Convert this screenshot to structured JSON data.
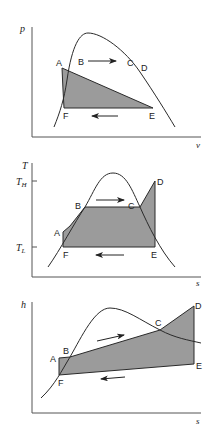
{
  "colors": {
    "line": "#2a2a2a",
    "fill": "#9b9b9b",
    "axis": "#555555",
    "background": "#ffffff"
  },
  "panels": [
    {
      "id": "p-v",
      "y_axis_label": "p",
      "x_axis_label": "v",
      "points": {
        "A": "A",
        "B": "B",
        "C": "C",
        "D": "D",
        "E": "E",
        "F": "F"
      },
      "arrows": [
        "right-arrow-top",
        "left-arrow-bottom"
      ]
    },
    {
      "id": "T-s",
      "y_axis_label": "T",
      "x_axis_label": "s",
      "tick_high": "T",
      "tick_high_sub": "H",
      "tick_low": "T",
      "tick_low_sub": "L",
      "points": {
        "A": "A",
        "B": "B",
        "C": "C",
        "D": "D",
        "E": "E",
        "F": "F"
      },
      "arrows": [
        "right-arrow-top",
        "left-arrow-bottom"
      ]
    },
    {
      "id": "h-s",
      "y_axis_label": "h",
      "x_axis_label": "s",
      "points": {
        "A": "A",
        "B": "B",
        "C": "C",
        "D": "D",
        "E": "E",
        "F": "F"
      },
      "arrows": [
        "right-arrow-top",
        "left-arrow-bottom"
      ]
    }
  ]
}
